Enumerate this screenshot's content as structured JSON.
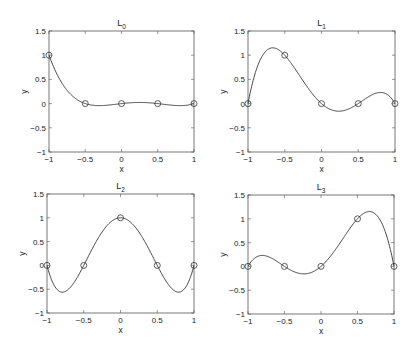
{
  "chart_data": [
    {
      "type": "line",
      "title": "L_0",
      "title_main": "L",
      "title_sub": "0",
      "xlabel": "x",
      "ylabel": "y",
      "xlim": [
        -1,
        1
      ],
      "ylim": [
        -1,
        1.5
      ],
      "xticks": [
        "-1",
        "-0.5",
        "0",
        "0.5",
        "1"
      ],
      "yticks": [
        "-1",
        "-0.5",
        "0",
        "0.5",
        "1",
        "1.5"
      ],
      "nodes_x": [
        -1,
        -0.5,
        0,
        0.5,
        1
      ],
      "markers": [
        {
          "x": -1,
          "y": 1
        },
        {
          "x": -0.5,
          "y": 0
        },
        {
          "x": 0,
          "y": 0
        },
        {
          "x": 0.5,
          "y": 0
        },
        {
          "x": 1,
          "y": 0
        }
      ],
      "basis_index": 0,
      "grid": false
    },
    {
      "type": "line",
      "title": "L_1",
      "title_main": "L",
      "title_sub": "1",
      "xlabel": "x",
      "ylabel": "y",
      "xlim": [
        -1,
        1
      ],
      "ylim": [
        -1,
        1.5
      ],
      "xticks": [
        "-1",
        "-0.5",
        "0",
        "0.5",
        "1"
      ],
      "yticks": [
        "-1",
        "-0.5",
        "0",
        "0.5",
        "1",
        "1.5"
      ],
      "nodes_x": [
        -1,
        -0.5,
        0,
        0.5,
        1
      ],
      "markers": [
        {
          "x": -1,
          "y": 0
        },
        {
          "x": -0.5,
          "y": 1
        },
        {
          "x": 0,
          "y": 0
        },
        {
          "x": 0.5,
          "y": 0
        },
        {
          "x": 1,
          "y": 0
        }
      ],
      "basis_index": 1,
      "grid": false
    },
    {
      "type": "line",
      "title": "L_2",
      "title_main": "L",
      "title_sub": "2",
      "xlabel": "x",
      "ylabel": "y",
      "xlim": [
        -1,
        1
      ],
      "ylim": [
        -1,
        1.5
      ],
      "xticks": [
        "-1",
        "-0.5",
        "0",
        "0.5",
        "1"
      ],
      "yticks": [
        "-1",
        "-0.5",
        "0",
        "0.5",
        "1",
        "1.5"
      ],
      "nodes_x": [
        -1,
        -0.5,
        0,
        0.5,
        1
      ],
      "markers": [
        {
          "x": -1,
          "y": 0
        },
        {
          "x": -0.5,
          "y": 0
        },
        {
          "x": 0,
          "y": 1
        },
        {
          "x": 0.5,
          "y": 0
        },
        {
          "x": 1,
          "y": 0
        }
      ],
      "basis_index": 2,
      "grid": false
    },
    {
      "type": "line",
      "title": "L_3",
      "title_main": "L",
      "title_sub": "3",
      "xlabel": "x",
      "ylabel": "y",
      "xlim": [
        -1,
        1
      ],
      "ylim": [
        -1,
        1.5
      ],
      "xticks": [
        "-1",
        "-0.5",
        "0",
        "0.5",
        "1"
      ],
      "yticks": [
        "-1",
        "-0.5",
        "0",
        "0.5",
        "1",
        "1.5"
      ],
      "nodes_x": [
        -1,
        -0.5,
        0,
        0.5,
        1
      ],
      "markers": [
        {
          "x": -1,
          "y": 0
        },
        {
          "x": -0.5,
          "y": 0
        },
        {
          "x": 0,
          "y": 0
        },
        {
          "x": 0.5,
          "y": 1
        },
        {
          "x": 1,
          "y": 0
        }
      ],
      "basis_index": 3,
      "grid": false
    }
  ]
}
